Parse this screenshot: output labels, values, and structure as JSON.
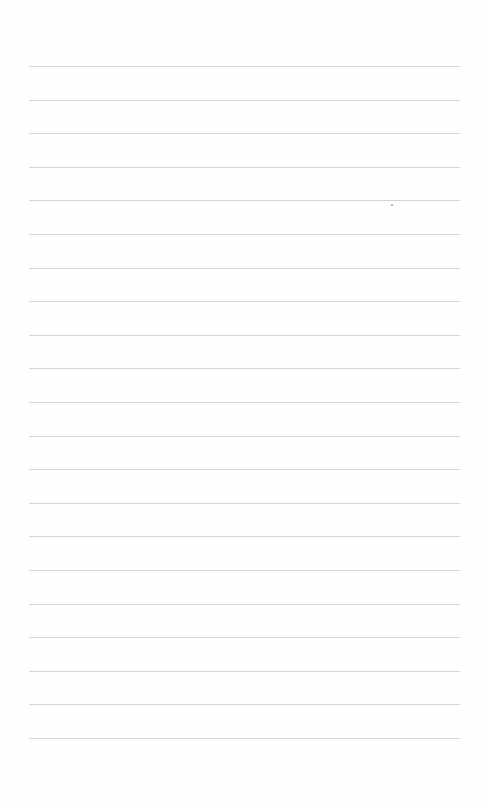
{
  "sheet": {
    "type": "blank lined paper",
    "background": "#fefefe",
    "line_color": "#cfcfcf",
    "line_count": 21,
    "first_line_y": 66,
    "line_spacing": 33.6,
    "line_left": 29,
    "line_width": 431
  }
}
